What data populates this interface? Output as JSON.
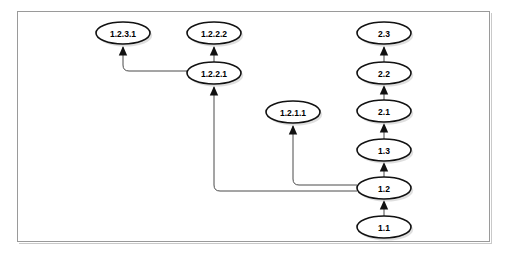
{
  "figure": {
    "frame": {
      "x": 17,
      "y": 11,
      "width": 473,
      "height": 231,
      "border_color": "#9a9a9a"
    },
    "background_color": "#ffffff",
    "node_fill_color": "#ffffff",
    "node_stroke_color": "#111111",
    "edge_color": "#4a4a4a",
    "arrow_color": "#111111",
    "label_color": "#000000"
  },
  "nodes": [
    {
      "id": "n_1_2_3_1",
      "label": "1.2.3.1",
      "cx": 123,
      "cy": 33,
      "rx": 27,
      "ry": 11
    },
    {
      "id": "n_1_2_2_2",
      "label": "1.2.2.2",
      "cx": 214,
      "cy": 33,
      "rx": 27,
      "ry": 11
    },
    {
      "id": "n_2_3",
      "label": "2.3",
      "cx": 384,
      "cy": 33,
      "rx": 27,
      "ry": 11
    },
    {
      "id": "n_1_2_2_1",
      "label": "1.2.2.1",
      "cx": 214,
      "cy": 73,
      "rx": 27,
      "ry": 11
    },
    {
      "id": "n_2_2",
      "label": "2.2",
      "cx": 384,
      "cy": 73,
      "rx": 27,
      "ry": 11
    },
    {
      "id": "n_1_2_1_1",
      "label": "1.2.1.1",
      "cx": 293,
      "cy": 112,
      "rx": 27,
      "ry": 11
    },
    {
      "id": "n_2_1",
      "label": "2.1",
      "cx": 384,
      "cy": 111,
      "rx": 27,
      "ry": 11
    },
    {
      "id": "n_1_3",
      "label": "1.3",
      "cx": 384,
      "cy": 150,
      "rx": 27,
      "ry": 11
    },
    {
      "id": "n_1_2",
      "label": "1.2",
      "cx": 384,
      "cy": 188,
      "rx": 27,
      "ry": 11
    },
    {
      "id": "n_1_1",
      "label": "1.1",
      "cx": 384,
      "cy": 227,
      "rx": 27,
      "ry": 11
    }
  ],
  "edges": [
    {
      "id": "e_1_1_to_1_2",
      "from": "1.1",
      "to": "1.2",
      "kind": "straight-up",
      "path": "M 384 216 L 384 201"
    },
    {
      "id": "e_1_2_to_1_3",
      "from": "1.2",
      "to": "1.3",
      "kind": "straight-up",
      "path": "M 384 177 L 384 163"
    },
    {
      "id": "e_1_3_to_2_1",
      "from": "1.3",
      "to": "2.1",
      "kind": "straight-up",
      "path": "M 384 139 L 384 124"
    },
    {
      "id": "e_2_1_to_2_2",
      "from": "2.1",
      "to": "2.2",
      "kind": "straight-up",
      "path": "M 384 100 L 384 86"
    },
    {
      "id": "e_2_2_to_2_3",
      "from": "2.2",
      "to": "2.3",
      "kind": "straight-up",
      "path": "M 384 62 L 384 47"
    },
    {
      "id": "e_1_2_to_1_2_1_1",
      "from": "1.2",
      "to": "1.2.1.1",
      "kind": "elbow-left-up",
      "path": "M 357 185 L 299 185 Q 293 185 293 179 L 293 126"
    },
    {
      "id": "e_1_2_to_1_2_2_1",
      "from": "1.2",
      "to": "1.2.2.1",
      "kind": "elbow-left-up",
      "path": "M 357 191 L 220 191 Q 214 191 214 185 L 214 87"
    },
    {
      "id": "e_1_2_2_1_to_1_2_2_2",
      "from": "1.2.2.1",
      "to": "1.2.2.2",
      "kind": "straight-up",
      "path": "M 214 62 L 214 47"
    },
    {
      "id": "e_1_2_2_1_to_1_2_3_1",
      "from": "1.2.2.1",
      "to": "1.2.3.1",
      "kind": "elbow-left-up",
      "path": "M 187 71 L 129 71 Q 123 71 123 65 L 123 47"
    }
  ],
  "legend": {
    "description": "Version numbers branching upward from revision 1.1"
  }
}
